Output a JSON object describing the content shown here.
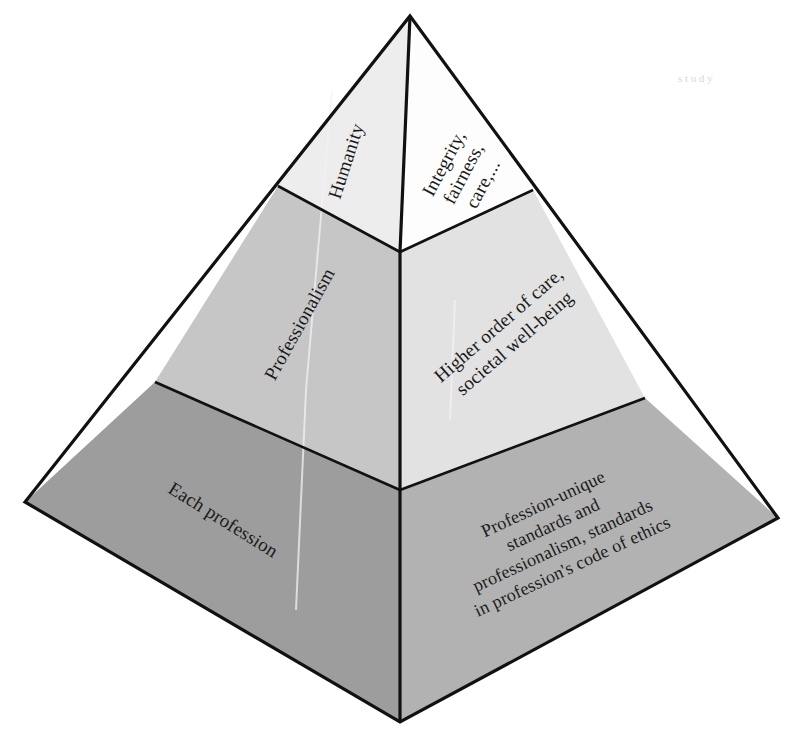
{
  "diagram": {
    "type": "3d-pyramid",
    "title_visible": false,
    "background_color": "#ffffff",
    "outline_color": "#111111",
    "tier_count": 3,
    "faces": [
      {
        "id": "top-left",
        "tier": 1,
        "side": "left",
        "label": "Humanity",
        "fill": "#ededed"
      },
      {
        "id": "top-right",
        "tier": 1,
        "side": "right",
        "label_lines": [
          "Integrity,",
          "fairness,",
          "care,..."
        ],
        "fill": "#fdfdfd"
      },
      {
        "id": "middle-left",
        "tier": 2,
        "side": "left",
        "label": "Professionalism",
        "fill": "#c6c6c6"
      },
      {
        "id": "middle-right",
        "tier": 2,
        "side": "right",
        "label_lines": [
          "Higher order of care,",
          "societal well-being"
        ],
        "fill": "#e2e2e2"
      },
      {
        "id": "bottom-left",
        "tier": 3,
        "side": "left",
        "label": "Each profession",
        "fill": "#9d9d9d"
      },
      {
        "id": "bottom-right",
        "tier": 3,
        "side": "right",
        "label_lines": [
          "Profession-unique",
          "standards and",
          "professionalism, standards",
          "in profession's code of ethics"
        ],
        "fill": "#b2b2b2"
      }
    ],
    "labels": {
      "humanity": "Humanity",
      "integrity_line_1": "Integrity,",
      "integrity_line_2": "fairness,",
      "integrity_line_3": "care,...",
      "professionalism": "Professionalism",
      "higher_order_line_1": "Higher order of care,",
      "higher_order_line_2": "societal well-being",
      "each_profession": "Each profession",
      "profession_unique_line_1": "Profession-unique",
      "profession_unique_line_2": "standards and",
      "profession_unique_line_3": "professionalism, standards",
      "profession_unique_line_4": "in profession's code of ethics"
    },
    "faint_artifact": "s t u d y"
  }
}
